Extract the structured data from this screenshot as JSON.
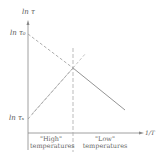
{
  "diagram": {
    "y_axis_label": "ln τ",
    "x_axis_label": "1/T",
    "y_tick_upper": "ln τ₀",
    "y_tick_lower": "ln τₛ",
    "regions": [
      {
        "line1": "\"High\"",
        "line2": "temperatures"
      },
      {
        "line1": "\"Low\"",
        "line2": "temperatures"
      }
    ],
    "colors": {
      "ink": "#777777",
      "dashed": "#999999"
    }
  }
}
